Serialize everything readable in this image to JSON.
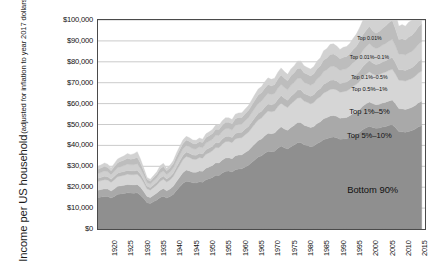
{
  "chart_data": {
    "type": "area",
    "stacked": true,
    "title": "",
    "xlabel": "",
    "ylabel": "Income per US household",
    "ylabel_sub": "(adjusted for inflation to year 2017 dollars)",
    "ylim": [
      0,
      100000
    ],
    "ytick_values": [
      0,
      10000,
      20000,
      30000,
      40000,
      50000,
      60000,
      70000,
      80000,
      90000,
      100000
    ],
    "ytick_labels": [
      "$0",
      "$10,000",
      "$20,000",
      "$30,000",
      "$40,000",
      "$50,000",
      "$60,000",
      "$70,000",
      "$80,000",
      "$90,000",
      "$100,000"
    ],
    "xlim": [
      1917,
      2017
    ],
    "xtick_values": [
      1920,
      1925,
      1930,
      1935,
      1940,
      1945,
      1950,
      1955,
      1960,
      1965,
      1970,
      1975,
      1980,
      1985,
      1990,
      1995,
      2000,
      2005,
      2010,
      2015
    ],
    "xtick_labels": [
      "1920",
      "1925",
      "1930",
      "1935",
      "1940",
      "1945",
      "1950",
      "1955",
      "1960",
      "1965",
      "1970",
      "1975",
      "1980",
      "1985",
      "1990",
      "1995",
      "2000",
      "2005",
      "2010",
      "2015"
    ],
    "grid": true,
    "legend_position": "in-plot-annotations",
    "x": [
      1917,
      1918,
      1919,
      1920,
      1921,
      1922,
      1923,
      1924,
      1925,
      1926,
      1927,
      1928,
      1929,
      1930,
      1931,
      1932,
      1933,
      1934,
      1935,
      1936,
      1937,
      1938,
      1939,
      1940,
      1941,
      1942,
      1943,
      1944,
      1945,
      1946,
      1947,
      1948,
      1949,
      1950,
      1951,
      1952,
      1953,
      1954,
      1955,
      1956,
      1957,
      1958,
      1959,
      1960,
      1961,
      1962,
      1963,
      1964,
      1965,
      1966,
      1967,
      1968,
      1969,
      1970,
      1971,
      1972,
      1973,
      1974,
      1975,
      1976,
      1977,
      1978,
      1979,
      1980,
      1981,
      1982,
      1983,
      1984,
      1985,
      1986,
      1987,
      1988,
      1989,
      1990,
      1991,
      1992,
      1993,
      1994,
      1995,
      1996,
      1997,
      1998,
      1999,
      2000,
      2001,
      2002,
      2003,
      2004,
      2005,
      2006,
      2007,
      2008,
      2009,
      2010,
      2011,
      2012,
      2013,
      2014,
      2015,
      2016
    ],
    "series": [
      {
        "name": "Bottom 90%",
        "order": 1,
        "color": "#8f8f8f",
        "values": [
          15100,
          15300,
          15600,
          15500,
          14800,
          15600,
          16600,
          16800,
          17000,
          17300,
          17200,
          17100,
          17300,
          16200,
          14600,
          12600,
          12200,
          13100,
          13900,
          15100,
          15700,
          14800,
          15500,
          16500,
          18400,
          20200,
          21900,
          22900,
          22600,
          22100,
          22000,
          22600,
          22400,
          23600,
          24100,
          24700,
          25700,
          25600,
          26800,
          27600,
          27700,
          27300,
          28400,
          28700,
          28800,
          29700,
          30500,
          31800,
          33100,
          34400,
          35000,
          36200,
          37200,
          37000,
          37200,
          38600,
          39700,
          38900,
          38300,
          39400,
          40200,
          41300,
          41400,
          40300,
          39900,
          39400,
          39700,
          40900,
          41600,
          42800,
          43200,
          43800,
          44000,
          43700,
          42900,
          43100,
          43200,
          43900,
          44800,
          45300,
          46300,
          47600,
          48500,
          49200,
          48600,
          48200,
          48300,
          48800,
          49100,
          49600,
          49900,
          48500,
          46600,
          46500,
          46300,
          46700,
          47100,
          47800,
          48900,
          49400
        ]
      },
      {
        "name": "Top 5%-10%",
        "order": 2,
        "color": "#a9a9a9",
        "values": [
          3500,
          3600,
          3600,
          3600,
          3400,
          3600,
          3800,
          3900,
          3900,
          4000,
          4000,
          4000,
          4000,
          3800,
          3400,
          3000,
          2900,
          3100,
          3300,
          3500,
          3700,
          3500,
          3600,
          3900,
          4300,
          4700,
          5100,
          5300,
          5200,
          5100,
          5100,
          5200,
          5200,
          5500,
          5600,
          5700,
          6000,
          6000,
          6200,
          6400,
          6400,
          6300,
          6600,
          6700,
          6700,
          6900,
          7100,
          7400,
          7700,
          8000,
          8100,
          8400,
          8600,
          8600,
          8700,
          9000,
          9200,
          9000,
          8900,
          9200,
          9400,
          9600,
          9600,
          9400,
          9300,
          9200,
          9300,
          9600,
          9700,
          10000,
          10100,
          10300,
          10300,
          10200,
          10100,
          10100,
          10200,
          10300,
          10500,
          10700,
          10900,
          11200,
          11400,
          11600,
          11400,
          11300,
          11400,
          11500,
          11600,
          11700,
          11800,
          11400,
          11000,
          11000,
          10900,
          11000,
          11100,
          11300,
          11500,
          11700
        ]
      },
      {
        "name": "Top 1%-5%",
        "order": 3,
        "color": "#d6d6d6",
        "values": [
          4200,
          4300,
          4400,
          4300,
          4100,
          4400,
          4600,
          4700,
          4800,
          4900,
          4800,
          4800,
          4900,
          4600,
          4100,
          3600,
          3500,
          3700,
          3900,
          4300,
          4400,
          4200,
          4400,
          4700,
          5200,
          5700,
          6200,
          6500,
          6400,
          6200,
          6200,
          6400,
          6300,
          6700,
          6800,
          7000,
          7300,
          7300,
          7600,
          7800,
          7800,
          7700,
          8100,
          8200,
          8200,
          8500,
          8700,
          9100,
          9500,
          9800,
          10000,
          10300,
          10600,
          10500,
          10600,
          11000,
          11300,
          11100,
          10900,
          11300,
          11500,
          11800,
          11800,
          11500,
          11400,
          11300,
          11500,
          11800,
          12000,
          12300,
          12500,
          12700,
          12700,
          12600,
          12400,
          12500,
          12600,
          12800,
          13000,
          13200,
          13500,
          13900,
          14100,
          14400,
          14200,
          14100,
          14200,
          14300,
          14400,
          14600,
          14700,
          14200,
          13600,
          13600,
          13600,
          13700,
          13800,
          14000,
          14300,
          14500
        ]
      },
      {
        "name": "Top 0.5%-1%",
        "order": 4,
        "color": "#b9b9b9",
        "values": [
          1500,
          1550,
          1600,
          1550,
          1450,
          1600,
          1700,
          1750,
          1800,
          1850,
          1820,
          1850,
          1900,
          1700,
          1450,
          1200,
          1150,
          1250,
          1350,
          1500,
          1550,
          1400,
          1480,
          1600,
          1800,
          1950,
          2050,
          2100,
          2050,
          2000,
          2000,
          2050,
          2000,
          2150,
          2200,
          2250,
          2350,
          2350,
          2450,
          2500,
          2480,
          2450,
          2600,
          2630,
          2620,
          2720,
          2800,
          2950,
          3080,
          3200,
          3250,
          3350,
          3420,
          3350,
          3380,
          3520,
          3620,
          3520,
          3450,
          3600,
          3680,
          3780,
          3780,
          3660,
          3620,
          3600,
          3700,
          3850,
          3950,
          4150,
          4200,
          4350,
          4350,
          4280,
          4200,
          4300,
          4320,
          4400,
          4550,
          4700,
          4900,
          5080,
          5250,
          5400,
          5200,
          5100,
          5200,
          5350,
          5450,
          5600,
          5700,
          5350,
          4950,
          5050,
          5000,
          5150,
          5200,
          5350,
          5500,
          5600
        ]
      },
      {
        "name": "Top 0.1%-0.5%",
        "order": 5,
        "color": "#cfcfcf",
        "values": [
          2300,
          2400,
          2500,
          2400,
          2200,
          2450,
          2650,
          2750,
          2850,
          2950,
          2900,
          3000,
          3100,
          2700,
          2250,
          1850,
          1750,
          1900,
          2050,
          2350,
          2400,
          2150,
          2280,
          2450,
          2750,
          2950,
          3100,
          3150,
          3100,
          3000,
          3000,
          3050,
          3000,
          3200,
          3280,
          3350,
          3500,
          3500,
          3650,
          3720,
          3680,
          3620,
          3850,
          3880,
          3860,
          4000,
          4120,
          4330,
          4520,
          4700,
          4780,
          4920,
          5030,
          4920,
          4960,
          5180,
          5330,
          5180,
          5060,
          5280,
          5400,
          5550,
          5550,
          5360,
          5300,
          5280,
          5430,
          5650,
          5800,
          6150,
          6250,
          6480,
          6480,
          6350,
          6220,
          6380,
          6400,
          6520,
          6750,
          7000,
          7330,
          7620,
          7900,
          8150,
          7800,
          7620,
          7800,
          8050,
          8250,
          8500,
          8650,
          8080,
          7400,
          7550,
          7480,
          7700,
          7780,
          8000,
          8250,
          8400
        ]
      },
      {
        "name": "Top 0.01%-0.1%",
        "order": 6,
        "color": "#bdbdbd",
        "values": [
          2000,
          2100,
          2250,
          2100,
          1900,
          2150,
          2400,
          2500,
          2650,
          2800,
          2700,
          2900,
          3100,
          2500,
          1950,
          1500,
          1400,
          1550,
          1700,
          2050,
          2100,
          1800,
          1900,
          2050,
          2300,
          2450,
          2550,
          2600,
          2550,
          2450,
          2450,
          2500,
          2450,
          2600,
          2680,
          2750,
          2880,
          2880,
          3000,
          3060,
          3020,
          2980,
          3180,
          3200,
          3180,
          3300,
          3420,
          3620,
          3800,
          3980,
          4050,
          4200,
          4300,
          4180,
          4220,
          4420,
          4550,
          4400,
          4280,
          4500,
          4600,
          4750,
          4750,
          4550,
          4500,
          4480,
          4650,
          4880,
          5050,
          5500,
          5600,
          5900,
          5900,
          5750,
          5600,
          5800,
          5820,
          5950,
          6250,
          6600,
          7050,
          7500,
          7900,
          8300,
          7700,
          7400,
          7650,
          8050,
          8400,
          8800,
          9000,
          8100,
          7100,
          7350,
          7200,
          7600,
          7700,
          8000,
          8350,
          8550
        ]
      },
      {
        "name": "Top 0.01%",
        "order": 7,
        "color": "#d2d2d2",
        "values": [
          1400,
          1500,
          1650,
          1500,
          1300,
          1550,
          1800,
          1900,
          2100,
          2300,
          2150,
          2400,
          2700,
          1950,
          1400,
          950,
          880,
          1000,
          1150,
          1500,
          1550,
          1200,
          1300,
          1420,
          1600,
          1700,
          1750,
          1780,
          1750,
          1680,
          1680,
          1700,
          1650,
          1780,
          1830,
          1880,
          1980,
          1980,
          2080,
          2130,
          2100,
          2060,
          2220,
          2230,
          2210,
          2300,
          2400,
          2580,
          2730,
          2900,
          2960,
          3100,
          3180,
          3050,
          3080,
          3260,
          3380,
          3230,
          3100,
          3300,
          3380,
          3520,
          3520,
          3320,
          3280,
          3260,
          3430,
          3660,
          3820,
          4400,
          4500,
          4850,
          4850,
          4680,
          4500,
          4750,
          4780,
          4920,
          5300,
          5750,
          6350,
          6950,
          7500,
          8050,
          7200,
          6800,
          7100,
          7650,
          8100,
          8650,
          8950,
          7700,
          6400,
          6750,
          6550,
          7100,
          7200,
          7550,
          8000,
          8250
        ]
      }
    ],
    "annotations": [
      {
        "text": "Top 0.01%",
        "x": 2000,
        "y": 91500,
        "size": 5.2
      },
      {
        "text": "Top 0.01%–0.1%",
        "x": 2000,
        "y": 82500,
        "size": 5.2
      },
      {
        "text": "Top 0.1%–0.5%",
        "x": 2000,
        "y": 72500,
        "size": 5.2
      },
      {
        "text": "Top 0.5%–1%",
        "x": 2000,
        "y": 67000,
        "size": 5.8
      },
      {
        "text": "Top 1%–5%",
        "x": 2000,
        "y": 56500,
        "size": 7.6
      },
      {
        "text": "Top 5%–10%",
        "x": 2000,
        "y": 45000,
        "size": 7.6
      },
      {
        "text": "Bottom 90%",
        "x": 2001,
        "y": 19000,
        "size": 9.4
      }
    ]
  },
  "style": {
    "plot_border_color": "#4a4a4a",
    "gridline_color": "#b4b4b4",
    "plot_background": "#ffffff",
    "text_color": "#111111"
  }
}
